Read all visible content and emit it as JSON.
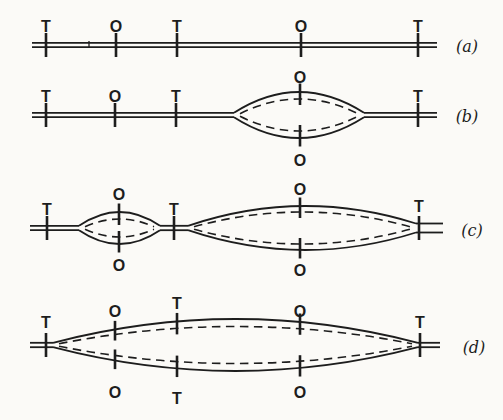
{
  "colors": {
    "ink": "#1d1d1d",
    "background": "#fbfaf7"
  },
  "marker_letters": {
    "origin": "O",
    "terminus": "T"
  },
  "rows": [
    {
      "name": "a",
      "cy": 45,
      "row_label": {
        "text": "(a)",
        "x": 467,
        "y": 46
      },
      "duplexes": [
        {
          "x1": 32,
          "x2": 437
        }
      ],
      "line_markers": [
        {
          "x": 46,
          "letter": "T"
        },
        {
          "x": 116,
          "letter": "O"
        },
        {
          "x": 177,
          "letter": "T"
        },
        {
          "x": 301,
          "letter": "O"
        },
        {
          "x": 418,
          "letter": "T"
        }
      ],
      "artifact_ticks": [
        {
          "x": 89
        }
      ],
      "bubbles": []
    },
    {
      "name": "b",
      "cy": 115,
      "row_label": {
        "text": "(b)",
        "x": 467,
        "y": 116
      },
      "duplexes": [
        {
          "x1": 32,
          "x2": 234
        },
        {
          "x1": 364,
          "x2": 437
        }
      ],
      "line_markers": [
        {
          "x": 46,
          "letter": "T"
        },
        {
          "x": 115,
          "letter": "O"
        },
        {
          "x": 176,
          "letter": "T"
        },
        {
          "x": 418,
          "letter": "T"
        }
      ],
      "artifact_ticks": [],
      "bubbles": [
        {
          "x1": 234,
          "x2": 364,
          "h": 23,
          "hd": 16,
          "markers": [
            {
              "x": 300,
              "letter": "O",
              "label_top_y": 77,
              "label_bottom_y": 160
            }
          ]
        }
      ]
    },
    {
      "name": "c",
      "cy": 228,
      "row_label": {
        "text": "(c)",
        "x": 472,
        "y": 230
      },
      "duplexes": [
        {
          "x1": 30,
          "x2": 79
        },
        {
          "x1": 160,
          "x2": 188
        },
        {
          "x1": 416,
          "x2": 443,
          "gap": 9
        }
      ],
      "line_markers": [
        {
          "x": 47,
          "letter": "T"
        },
        {
          "x": 174,
          "letter": "T"
        },
        {
          "x": 419,
          "letter": "T",
          "label_y": 206
        }
      ],
      "artifact_ticks": [],
      "bubbles": [
        {
          "x1": 79,
          "x2": 160,
          "h": 16,
          "hd": 9,
          "markers": [
            {
              "x": 119,
              "letter": "O",
              "label_top_y": 194,
              "label_bottom_y": 265
            }
          ]
        },
        {
          "x1": 188,
          "x2": 416,
          "h": 22,
          "hd": 16,
          "gap2": 4.5,
          "markers": [
            {
              "x": 300,
              "letter": "O",
              "label_top_y": 189,
              "label_bottom_y": 270
            }
          ]
        }
      ]
    },
    {
      "name": "d",
      "cy": 345,
      "row_label": {
        "text": "(d)",
        "x": 474,
        "y": 347
      },
      "duplexes": [
        {
          "x1": 30,
          "x2": 53
        },
        {
          "x1": 418,
          "x2": 440
        }
      ],
      "line_markers": [
        {
          "x": 46,
          "letter": "T",
          "label_y": 322
        },
        {
          "x": 420,
          "letter": "T",
          "label_y": 322
        }
      ],
      "artifact_ticks": [],
      "bubbles": [
        {
          "x1": 53,
          "x2": 418,
          "h": 26,
          "hd": 18.5,
          "markers": [
            {
              "x": 115,
              "letter": "O",
              "label_top_y": 311,
              "label_bottom_y": 392
            },
            {
              "x": 177,
              "letter": "T",
              "label_top_y": 303,
              "label_bottom_y": 398
            },
            {
              "x": 300,
              "letter": "O",
              "label_top_y": 311,
              "label_bottom_y": 392
            }
          ]
        }
      ]
    }
  ]
}
